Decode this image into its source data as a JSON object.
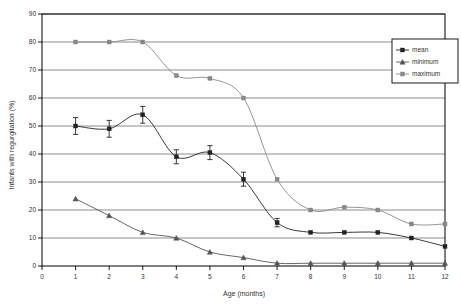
{
  "chart_data": {
    "type": "line",
    "title": "",
    "xlabel": "Age (months)",
    "ylabel": "Infants with regurgitation (%)",
    "xlim": [
      0,
      12
    ],
    "ylim": [
      0,
      90
    ],
    "xticks": [
      0,
      1,
      2,
      3,
      4,
      5,
      6,
      7,
      8,
      9,
      10,
      11,
      12
    ],
    "yticks": [
      0,
      10,
      20,
      30,
      40,
      50,
      60,
      70,
      80,
      90
    ],
    "grid": "horizontal",
    "legend_position": "top-right",
    "x": [
      1,
      2,
      3,
      4,
      5,
      6,
      7,
      8,
      9,
      10,
      11,
      12
    ],
    "series": [
      {
        "name": "mean",
        "marker": "square",
        "color": "#222222",
        "values": [
          50,
          49,
          54,
          39,
          40.5,
          31,
          15.5,
          12,
          12,
          12,
          10,
          7
        ],
        "errors": [
          3,
          3,
          3,
          2.5,
          2.5,
          2.5,
          1.5,
          0,
          0,
          0,
          0,
          0
        ]
      },
      {
        "name": "minimum",
        "marker": "triangle",
        "color": "#555555",
        "values": [
          24,
          18,
          12,
          10,
          5,
          3,
          1,
          1,
          1,
          1,
          1,
          1
        ]
      },
      {
        "name": "maximum",
        "marker": "square",
        "color": "#888888",
        "values": [
          80,
          80,
          80,
          68,
          67,
          60,
          31,
          20,
          21,
          20,
          15,
          15
        ]
      }
    ]
  },
  "axes": {
    "x_title": "Age (months)",
    "y_title": "Infants with regurgitation (%)",
    "x_tick_labels": [
      "0",
      "1",
      "2",
      "3",
      "4",
      "5",
      "6",
      "7",
      "8",
      "9",
      "10",
      "11",
      "12"
    ],
    "y_tick_labels": [
      "0",
      "10",
      "20",
      "30",
      "40",
      "50",
      "60",
      "70",
      "80",
      "90"
    ]
  },
  "legend": {
    "items": [
      {
        "label": "mean"
      },
      {
        "label": "minimum"
      },
      {
        "label": "maximum"
      }
    ]
  },
  "colors": {
    "mean": "#222222",
    "minimum": "#555555",
    "maximum": "#888888",
    "grid": "#808080",
    "frame": "#000000"
  }
}
